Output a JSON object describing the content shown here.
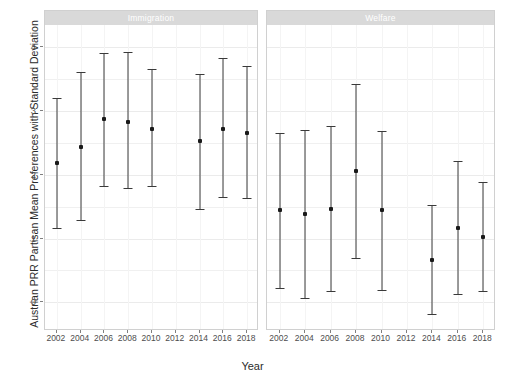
{
  "chart_data": {
    "type": "scatter",
    "title": "",
    "xlabel": "Year",
    "ylabel": "Austrian PRR Partisan Mean Preferences with Standard Deviation",
    "ylim": [
      -0.45,
      4.35
    ],
    "xlim": [
      2001,
      2019
    ],
    "yticks": [
      0,
      1,
      2,
      3,
      4
    ],
    "xticks": [
      2002,
      2004,
      2006,
      2008,
      2010,
      2012,
      2014,
      2016,
      2018
    ],
    "grid": true,
    "legend": "none",
    "facet_labels": [
      "Immigration",
      "Welfare"
    ],
    "series": [
      {
        "name": "Immigration",
        "x": [
          2002,
          2004,
          2006,
          2008,
          2010,
          2014,
          2016,
          2018
        ],
        "values": [
          2.19,
          2.44,
          2.87,
          2.83,
          2.72,
          2.53,
          2.72,
          2.66
        ],
        "lower": [
          1.17,
          1.29,
          1.82,
          1.8,
          1.83,
          1.47,
          1.65,
          1.64
        ],
        "upper": [
          3.21,
          3.61,
          3.91,
          3.93,
          3.66,
          3.58,
          3.83,
          3.7
        ]
      },
      {
        "name": "Welfare",
        "x": [
          2002,
          2004,
          2006,
          2008,
          2010,
          2014,
          2016,
          2018
        ],
        "values": [
          1.45,
          1.39,
          1.46,
          2.06,
          1.45,
          0.67,
          1.17,
          1.03
        ],
        "lower": [
          0.22,
          0.06,
          0.17,
          0.7,
          0.19,
          -0.18,
          0.13,
          0.18
        ],
        "upper": [
          2.66,
          2.7,
          2.76,
          3.43,
          2.68,
          1.52,
          2.21,
          1.88
        ]
      }
    ]
  },
  "style": {
    "point_color": "#1a1a1a",
    "bar_color": "#3a3a3a",
    "strip_background": "#d9d9d9",
    "strip_text_color": "#ffffff",
    "panel_background": "#ffffff",
    "grid_color": "#ebebeb",
    "axis_text_color": "#4d4d4d"
  }
}
